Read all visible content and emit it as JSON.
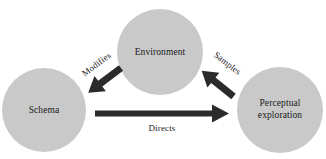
{
  "diagram": {
    "type": "cycle-diagram",
    "background_color": "#ffffff",
    "node_fill_color": "#c9c9c9",
    "arrow_color": "#2b2b2b",
    "text_color": "#1a1a1a",
    "nodes": [
      {
        "id": "environment",
        "label": "Environment",
        "label_lines": [
          "Environment"
        ],
        "cx": 160,
        "cy": 52,
        "r": 43
      },
      {
        "id": "schema",
        "label": "Schema",
        "label_lines": [
          "Schema"
        ],
        "cx": 44,
        "cy": 110,
        "r": 42
      },
      {
        "id": "perceptual-exploration",
        "label": "Perceptual exploration",
        "label_lines": [
          "Perceptual",
          "exploration"
        ],
        "cx": 280,
        "cy": 110,
        "r": 43
      }
    ],
    "edges": [
      {
        "id": "modifies",
        "label": "Modifies",
        "from": "environment",
        "to": "schema",
        "label_x": 97,
        "label_y": 65,
        "label_rotation": -37
      },
      {
        "id": "samples",
        "label": "Samples",
        "from": "perceptual-exploration",
        "to": "environment",
        "label_x": 227,
        "label_y": 64,
        "label_rotation": 38
      },
      {
        "id": "directs",
        "label": "Directs",
        "from": "schema",
        "to": "perceptual-exploration",
        "label_x": 162,
        "label_y": 129,
        "label_rotation": 0
      }
    ]
  }
}
